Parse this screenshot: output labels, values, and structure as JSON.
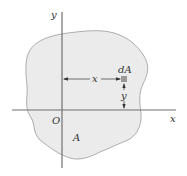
{
  "diagram": {
    "colors": {
      "region_fill": "#ebebeb",
      "region_stroke": "#9a9a9a",
      "axis": "#707070",
      "element": "#999999",
      "arrow": "#333333",
      "text": "#333333"
    },
    "axes": {
      "x_label": "x",
      "y_label": "y",
      "origin_label": "O"
    },
    "region": {
      "label": "A"
    },
    "element": {
      "label": "dA",
      "x_distance_label": "x",
      "y_distance_label": "y"
    }
  }
}
